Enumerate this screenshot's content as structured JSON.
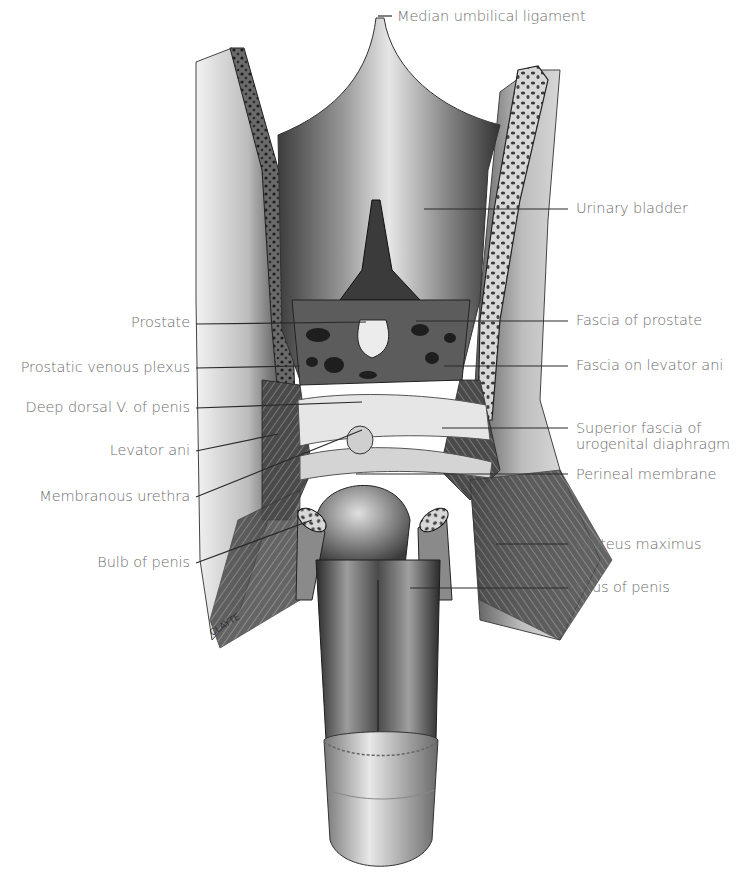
{
  "figure": {
    "type": "anatomical illustration",
    "signature": "CLAYTE"
  },
  "labels_left": [
    {
      "id": "prostate",
      "text": "Prostate"
    },
    {
      "id": "prostatic-venous-plexus",
      "text": "Prostatic venous plexus"
    },
    {
      "id": "deep-dorsal-v",
      "text": "Deep dorsal V. of penis"
    },
    {
      "id": "levator-ani",
      "text": "Levator ani"
    },
    {
      "id": "membranous-urethra",
      "text": "Membranous urethra"
    },
    {
      "id": "bulb-of-penis",
      "text": "Bulb of penis"
    }
  ],
  "labels_right": [
    {
      "id": "median-umbilical-ligament",
      "text": "Median umbilical ligament"
    },
    {
      "id": "urinary-bladder",
      "text": "Urinary bladder"
    },
    {
      "id": "fascia-of-prostate",
      "text": "Fascia of prostate"
    },
    {
      "id": "fascia-on-levator-ani",
      "text": "Fascia on levator ani"
    },
    {
      "id": "superior-fascia",
      "text": "Superior fascia of\nurogenital diaphragm"
    },
    {
      "id": "perineal-membrane",
      "text": "Perineal membrane"
    },
    {
      "id": "gluteus-maximus",
      "text": "Gluteus maximus"
    },
    {
      "id": "crus-of-penis",
      "text": "Crus of penis"
    }
  ],
  "colors": {
    "label_text": "#6e6e6e",
    "leader_line": "#2a2a2a",
    "background": "#ffffff"
  }
}
